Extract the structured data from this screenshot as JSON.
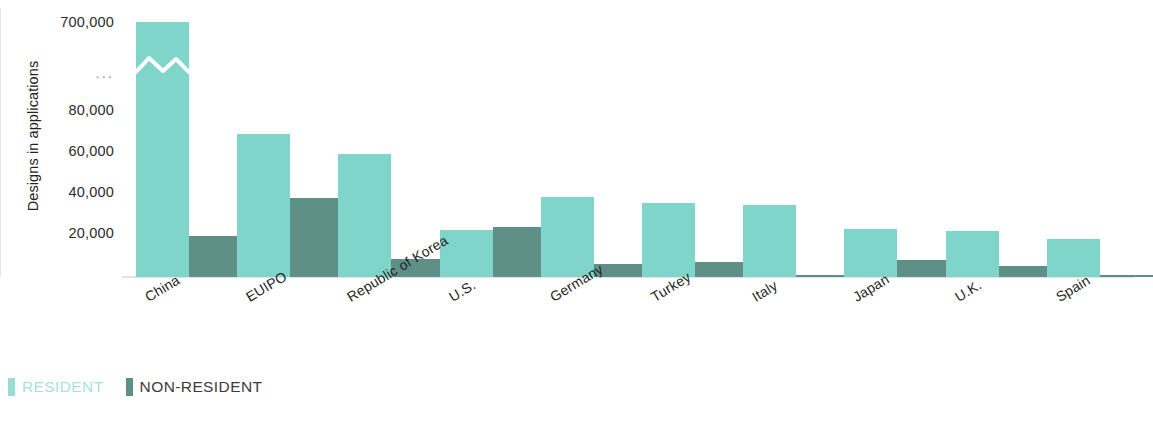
{
  "chart_data": {
    "type": "bar",
    "title": "",
    "xlabel": "",
    "ylabel": "Designs in applications",
    "grid": false,
    "legend_position": "bottom-left",
    "axis_note": "Broken y-axis: linear 0-80,000 then jump to 700,000 (break marked by white zigzag across the China resident bar)",
    "y_ticks": [
      "700,000",
      "...",
      "80,000",
      "60,000",
      "40,000",
      "20,000"
    ],
    "ylim": [
      0,
      700000
    ],
    "categories": [
      "China",
      "EUIPO",
      "Republic of Korea",
      "U.S.",
      "Germany",
      "Turkey",
      "Italy",
      "Japan",
      "U.K.",
      "Spain"
    ],
    "series": [
      {
        "name": "RESIDENT",
        "color": "#7fd5ca",
        "values": [
          695000,
          70000,
          60000,
          23000,
          39000,
          36000,
          35000,
          23500,
          22500,
          18500
        ]
      },
      {
        "name": "NON-RESIDENT",
        "color": "#5e9087",
        "values": [
          20000,
          38500,
          9000,
          24500,
          6500,
          7500,
          1200,
          8500,
          5500,
          800
        ]
      }
    ]
  },
  "axis": {
    "y_title": "Designs in applications",
    "y_ticks": [
      {
        "label": "700,000",
        "value": 700000
      },
      {
        "label": "...",
        "value": null
      },
      {
        "label": "80,000",
        "value": 80000
      },
      {
        "label": "60,000",
        "value": 60000
      },
      {
        "label": "40,000",
        "value": 40000
      },
      {
        "label": "20,000",
        "value": 20000
      }
    ]
  },
  "legend": {
    "items": [
      {
        "label": "RESIDENT",
        "color": "#9adcd3"
      },
      {
        "label": "NON-RESIDENT",
        "color": "#5e9087"
      }
    ]
  }
}
